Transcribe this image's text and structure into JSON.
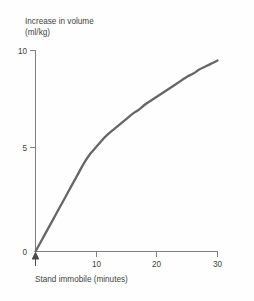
{
  "figure": {
    "background_color": "#fefefe",
    "curve_color": "#666666",
    "axis_color": "#808080",
    "text_color": "#3f3f3f"
  },
  "labels": {
    "ylabel_line1": "Increase in volume",
    "ylabel_line2": "(ml/kg)",
    "xlabel": "Stand immobile (minutes)",
    "ytick_0": "0",
    "ytick_5": "5",
    "ytick_10": "10",
    "xtick_10": "10",
    "xtick_20": "20",
    "xtick_30": "30",
    "origin_marker": "up-arrow"
  },
  "chart_data": {
    "type": "line",
    "title": "",
    "xlabel": "Stand immobile (minutes)",
    "ylabel": "Increase in volume (ml/kg)",
    "xlim": [
      0,
      30
    ],
    "ylim": [
      0,
      10
    ],
    "xticks": [
      0,
      10,
      20,
      30
    ],
    "xticklabels": [
      "0",
      "10",
      "20",
      "30"
    ],
    "yticks": [
      0,
      5,
      10
    ],
    "yticklabels": [
      "0",
      "5",
      "10"
    ],
    "grid": false,
    "legend": null,
    "series": [
      {
        "name": "Increase in volume",
        "color": "#666666",
        "x": [
          0,
          1,
          2,
          3,
          4,
          5,
          6,
          7,
          8,
          9,
          10,
          11,
          12,
          13,
          14,
          15,
          16,
          17,
          18,
          19,
          20,
          21,
          22,
          23,
          24,
          25,
          26,
          27,
          28,
          29,
          30
        ],
        "y": [
          0.0,
          0.55,
          1.1,
          1.65,
          2.2,
          2.75,
          3.3,
          3.85,
          4.4,
          4.85,
          5.2,
          5.55,
          5.85,
          6.1,
          6.35,
          6.6,
          6.85,
          7.05,
          7.3,
          7.5,
          7.7,
          7.9,
          8.1,
          8.3,
          8.5,
          8.7,
          8.85,
          9.05,
          9.2,
          9.35,
          9.5
        ]
      }
    ],
    "annotations": [
      {
        "name": "origin-up-arrow",
        "x": 0,
        "y": 0,
        "description": "upward arrow marking start of standing at time zero"
      }
    ]
  }
}
